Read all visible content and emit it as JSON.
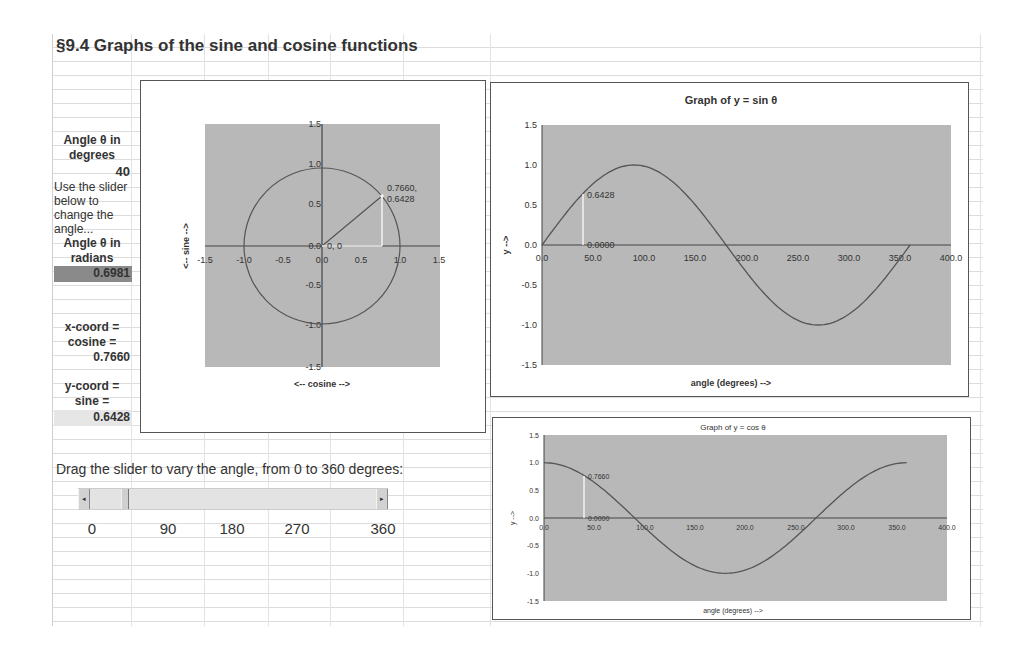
{
  "sheet": {
    "title": "§9.4  Graphs of the sine and cosine functions"
  },
  "side_panel": {
    "angle_deg_label_1": "Angle θ  in",
    "angle_deg_label_2": "degrees",
    "angle_deg_value": "40",
    "instructions": [
      "Use the slider",
      "below to",
      "change the",
      "angle..."
    ],
    "angle_rad_label_1": "Angle  θ  in",
    "angle_rad_label_2": "radians",
    "angle_rad_value": "0.6981",
    "x_coord_label_1": "x-coord =",
    "x_coord_label_2": "cosine =",
    "x_coord_value": "0.7660",
    "y_coord_label_1": "y-coord =",
    "y_coord_label_2": "sine =",
    "y_coord_value": "0.6428"
  },
  "slider": {
    "instruction": "Drag the slider to vary the angle, from  0  to  360  degrees:",
    "min": 0,
    "max": 360,
    "value": 40,
    "left_arrow": "◂",
    "right_arrow": "▸",
    "tick_labels": [
      "0",
      "90",
      "180",
      "270",
      "360"
    ]
  },
  "colors": {
    "plot_bg": "#b8b8b8",
    "curve": "#555555",
    "highlight": "#f2f2f2",
    "axis": "#444444",
    "radians_cell": "#8a8a8a",
    "sine_cell": "#e6e6e6"
  },
  "chart_data": [
    {
      "type": "scatter",
      "title": "",
      "xlabel": "<-- cosine -->",
      "ylabel": "<-- sine -->",
      "xlim": [
        -1.5,
        1.5
      ],
      "ylim": [
        -1.5,
        1.5
      ],
      "xticks": [
        "-1.5",
        "-1.0",
        "-0.5",
        "0.0",
        "0.5",
        "1.0",
        "1.5"
      ],
      "yticks": [
        "1.5",
        "1.0",
        "0.5",
        "0.0",
        "-0.5",
        "-1.0",
        "-1.5"
      ],
      "series": [
        {
          "name": "unit circle",
          "description": "x = cos θ, y = sin θ, θ = 0..360"
        },
        {
          "name": "radius",
          "x": [
            0,
            0.766
          ],
          "y": [
            0,
            0.6428
          ]
        },
        {
          "name": "cosine projection",
          "x": [
            0,
            0.766
          ],
          "y": [
            0,
            0
          ]
        },
        {
          "name": "sine projection",
          "x": [
            0.766,
            0.766
          ],
          "y": [
            0,
            0.6428
          ]
        }
      ],
      "annotations": [
        {
          "text": "0, 0",
          "x": 0,
          "y": 0
        },
        {
          "text": "0.7660,",
          "x": 0.766,
          "y": 0.6428
        },
        {
          "text": "0.6428",
          "x": 0.766,
          "y": 0.6428
        }
      ],
      "grid": false,
      "legend": "none"
    },
    {
      "type": "line",
      "title": "Graph of  y  =  sin θ",
      "xlabel": "angle (degrees)  -->",
      "ylabel": "y -->",
      "xlim": [
        0,
        400
      ],
      "ylim": [
        -1.5,
        1.5
      ],
      "xticks": [
        "0.0",
        "50.0",
        "100.0",
        "150.0",
        "200.0",
        "250.0",
        "300.0",
        "350.0",
        "400.0"
      ],
      "yticks": [
        "1.5",
        "1.0",
        "0.5",
        "0.0",
        "-0.5",
        "-1.0",
        "-1.5"
      ],
      "series": [
        {
          "name": "y = sin θ",
          "x": [
            0,
            30,
            60,
            90,
            120,
            150,
            180,
            210,
            240,
            270,
            300,
            330,
            360
          ],
          "y": [
            0,
            0.5,
            0.866,
            1.0,
            0.866,
            0.5,
            0,
            -0.5,
            -0.866,
            -1.0,
            -0.866,
            -0.5,
            0
          ]
        },
        {
          "name": "marker",
          "x": [
            40,
            40
          ],
          "y": [
            0,
            0.6428
          ]
        }
      ],
      "annotations": [
        {
          "text": "0.6428",
          "x": 40,
          "y": 0.6428
        },
        {
          "text": "0.0000",
          "x": 40,
          "y": 0
        }
      ],
      "grid": false,
      "legend": "none"
    },
    {
      "type": "line",
      "title": "Graph of  y  =  cos θ",
      "xlabel": "angle (degrees)  -->",
      "ylabel": "y -->",
      "xlim": [
        0,
        400
      ],
      "ylim": [
        -1.5,
        1.5
      ],
      "xticks": [
        "0.0",
        "50.0",
        "100.0",
        "150.0",
        "200.0",
        "250.0",
        "300.0",
        "350.0",
        "400.0"
      ],
      "yticks": [
        "1.5",
        "1.0",
        "0.5",
        "0.0",
        "-0.5",
        "-1.0",
        "-1.5"
      ],
      "series": [
        {
          "name": "y = cos θ",
          "x": [
            0,
            30,
            60,
            90,
            120,
            150,
            180,
            210,
            240,
            270,
            300,
            330,
            360
          ],
          "y": [
            1.0,
            0.866,
            0.5,
            0,
            -0.5,
            -0.866,
            -1.0,
            -0.866,
            -0.5,
            0,
            0.5,
            0.866,
            1.0
          ]
        },
        {
          "name": "marker",
          "x": [
            40,
            40
          ],
          "y": [
            0,
            0.766
          ]
        }
      ],
      "annotations": [
        {
          "text": "0.7660",
          "x": 40,
          "y": 0.766
        },
        {
          "text": "0.0000",
          "x": 40,
          "y": 0
        }
      ],
      "grid": false,
      "legend": "none"
    }
  ]
}
